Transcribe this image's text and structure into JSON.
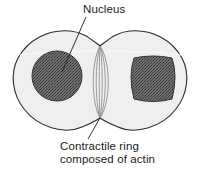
{
  "figure": {
    "name": "cytokinesis-dividing-cell-diagram",
    "background_color": "#ffffff"
  },
  "labels": {
    "nucleus": {
      "text": "Nucleus",
      "leader_from": "text-bottom-left",
      "leader_to": "left-nucleus"
    },
    "contractile_ring": {
      "line1": "Contractile ring",
      "line2": "composed of actin",
      "leader_from": "text-top",
      "leader_to": "bottom-cleavage-furrow"
    }
  },
  "structures": {
    "cell_membrane": {
      "name": "cell-membrane-outline",
      "fill": "#efefef",
      "stroke": "#2b2b2b"
    },
    "nucleus_left": {
      "name": "nucleus-left",
      "fill": "#5c5c5c",
      "stroke": "#333333",
      "shape": "ellipse"
    },
    "nucleus_right": {
      "name": "nucleus-right",
      "fill": "#5c5c5c",
      "stroke": "#333333",
      "shape": "rounded-square"
    },
    "contractile_ring": {
      "name": "contractile-ring-fibers",
      "stroke": "#8a8a8a",
      "fiber_count": 6
    }
  },
  "colors": {
    "cytoplasm": "#efefef",
    "nucleus": "#5c5c5c",
    "outline": "#2b2b2b",
    "ring_fiber": "#8a8a8a",
    "text": "#1a1a1a",
    "leader_line": "#1a1a1a"
  }
}
